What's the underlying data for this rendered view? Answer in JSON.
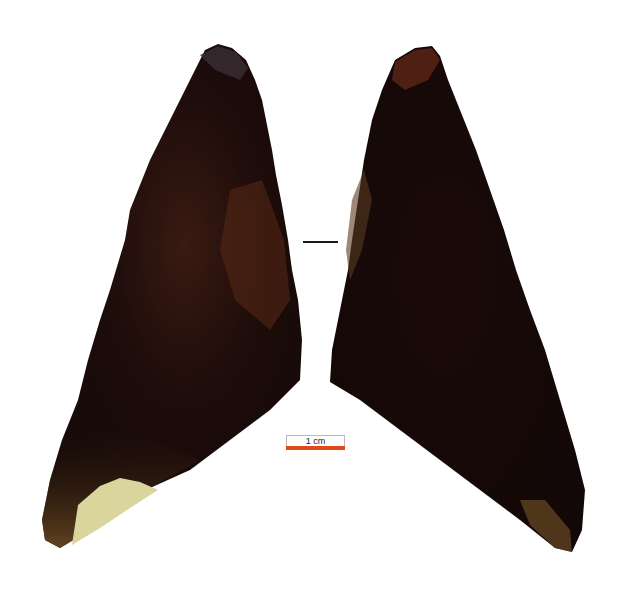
{
  "figure": {
    "views": [
      {
        "name": "left-view",
        "dominant_color": "#1e0e0b",
        "accent_color": "#6b3a1e",
        "cortex_color": "#d8d49a"
      },
      {
        "name": "right-view",
        "dominant_color": "#1a0b09",
        "accent_color": "#6b3a1e"
      }
    ],
    "section_marker": {
      "color": "#1a1a1a"
    },
    "scale_bar": {
      "label": "1 cm",
      "color": "#e04a1a"
    }
  }
}
